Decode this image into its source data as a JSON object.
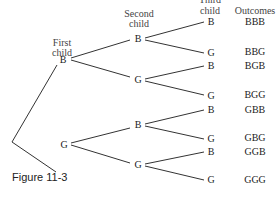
{
  "headers": {
    "first_child": [
      "First",
      "child"
    ],
    "second_child": [
      "Second",
      "child"
    ],
    "third_child": [
      "Third",
      "child"
    ],
    "outcomes": "Outcomes"
  },
  "nodes": {
    "first": [
      "B",
      "G"
    ],
    "second": [
      "B",
      "G",
      "B",
      "G"
    ],
    "third": [
      "B",
      "G",
      "B",
      "G",
      "B",
      "G",
      "B",
      "G"
    ]
  },
  "outcomes": [
    "BBB",
    "BBG",
    "BGB",
    "BGG",
    "GBB",
    "GBG",
    "GGB",
    "GGG"
  ],
  "caption": "Figure 11-3"
}
